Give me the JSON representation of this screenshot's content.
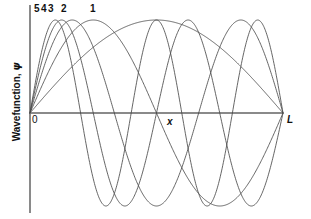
{
  "figure": {
    "background_color": "#ffffff",
    "curve_color": "#4a4a4a",
    "axis_color": "#8a8a8a",
    "text_color": "#111111",
    "width": 311,
    "height": 219
  },
  "axes": {
    "y_label_prefix": "Wavefunction, ",
    "y_label_symbol": "ψ",
    "y_label_full": "Wavefunction, ψ",
    "x_label": "x",
    "origin_label": "0",
    "end_label": "L",
    "x_axis_y_px": 113,
    "x_axis_start_px": 30,
    "x_axis_end_px": 283,
    "y_axis_x_px": 30,
    "y_axis_top_px": 5,
    "y_axis_bottom_px": 213
  },
  "curve_labels": [
    {
      "text": "5",
      "left_px": 34,
      "top_px": 4
    },
    {
      "text": "4",
      "left_px": 41,
      "top_px": 4
    },
    {
      "text": "3",
      "left_px": 48,
      "top_px": 4
    },
    {
      "text": "2",
      "left_px": 61,
      "top_px": 4
    },
    {
      "text": "1",
      "left_px": 90,
      "top_px": 4
    }
  ],
  "chart_data": {
    "type": "line",
    "xlabel": "x",
    "ylabel": "Wavefunction, ψ",
    "xlim": [
      0,
      1
    ],
    "ylim": [
      -1,
      1
    ],
    "xtick_labels": [
      "0",
      "L"
    ],
    "xtick_values": [
      0,
      1
    ],
    "ytick_labels": [],
    "grid": false,
    "legend": "inline-labels-at-top",
    "formula": "psi_n(x) = A * sin(n * pi * x / L)",
    "amplitude": 1,
    "series": [
      {
        "name": "1",
        "n": 1,
        "nodes": 0,
        "antinodes": 1,
        "label": "1"
      },
      {
        "name": "2",
        "n": 2,
        "nodes": 1,
        "antinodes": 2,
        "label": "2"
      },
      {
        "name": "3",
        "n": 3,
        "nodes": 2,
        "antinodes": 3,
        "label": "3"
      },
      {
        "name": "4",
        "n": 4,
        "nodes": 3,
        "antinodes": 4,
        "label": "4"
      },
      {
        "name": "5",
        "n": 5,
        "nodes": 4,
        "antinodes": 5,
        "label": "5"
      }
    ]
  }
}
